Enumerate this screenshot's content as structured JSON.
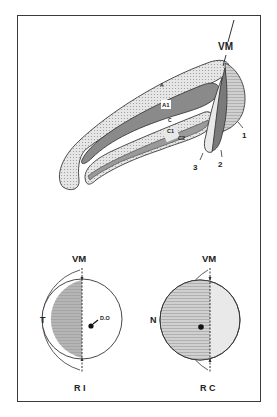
{
  "figure": {
    "top_diagram": {
      "description": "Lateral geniculate body laminae schematic",
      "midline_label": "VM",
      "layer_labels": {
        "A": "A",
        "A1": "A1",
        "C": "C",
        "C1": "C1",
        "C2": "C2"
      },
      "callouts": [
        "1",
        "2",
        "3"
      ]
    },
    "bottom_left": {
      "midline_label": "VM",
      "side_label": "T",
      "disc_label": "D.O",
      "caption": "R I"
    },
    "bottom_right": {
      "midline_label": "VM",
      "side_label": "N",
      "caption": "R C"
    }
  },
  "colors": {
    "outline": "#3a3a3a",
    "light_fill": "#d9d9d9",
    "dark_fill": "#8a8a8a",
    "mid_fill": "#b5b5b5",
    "paper": "#ffffff"
  }
}
